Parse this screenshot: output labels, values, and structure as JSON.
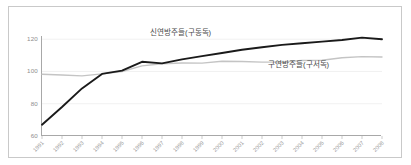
{
  "chart_data": {
    "type": "line",
    "title": "",
    "xlabel": "",
    "ylabel": "",
    "ylim": [
      60,
      122
    ],
    "yticks": [
      60,
      80,
      100,
      120
    ],
    "grid": true,
    "legend_position": "inline-annotation",
    "categories": [
      "1991",
      "1992",
      "1993",
      "1994",
      "1995",
      "1996",
      "1997",
      "1998",
      "1999",
      "2000",
      "2001",
      "2002",
      "2003",
      "2004",
      "2005",
      "2006",
      "2007",
      "2008"
    ],
    "series": [
      {
        "name": "신연방주들(구동독)",
        "color": "#1a1a1a",
        "values": [
          67.0,
          78.0,
          89.5,
          98.5,
          100.5,
          106.0,
          105.0,
          107.5,
          109.5,
          111.5,
          113.5,
          115.0,
          116.5,
          117.5,
          118.5,
          119.5,
          121.0,
          120.0
        ]
      },
      {
        "name": "구연방주들(구서독)",
        "color": "#c4c4c4",
        "values": [
          98.3,
          97.8,
          97.3,
          98.5,
          100.0,
          103.5,
          104.8,
          105.3,
          105.2,
          106.3,
          106.2,
          105.8,
          105.9,
          106.8,
          107.0,
          108.5,
          109.2,
          109.0
        ]
      }
    ],
    "annotations": [
      {
        "text": "신연방주들(구동독)",
        "series": 0
      },
      {
        "text": "구연방주들(구서독)",
        "series": 1
      }
    ]
  },
  "colors": {
    "background": "#ffffff",
    "frame_border": "#c9c9c9",
    "axis": "#a8a8a8",
    "gridline": "#ededed",
    "tick_label": "#8d8d8d",
    "annotation_text": "#4a4a4a",
    "series_new_states": "#1a1a1a",
    "series_old_states": "#c4c4c4"
  }
}
